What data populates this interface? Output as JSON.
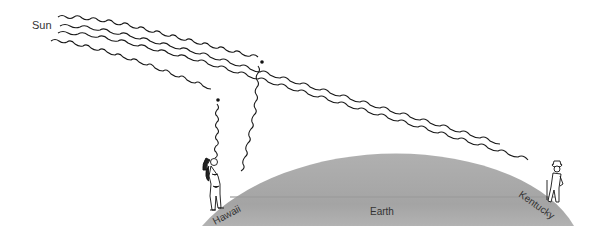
{
  "labels": {
    "sun": "Sun",
    "earth": "Earth",
    "left_location": "Hawaii",
    "right_location": "Kentucky"
  },
  "colors": {
    "earth_fill": "#a9a9a9",
    "wave_stroke": "#1a1a1a",
    "label_text": "#333333"
  },
  "figures": {
    "left": "person-in-bikini-looking-up",
    "right": "person-in-hat-looking-up"
  }
}
